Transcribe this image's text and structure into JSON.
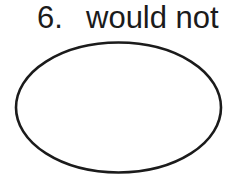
{
  "worksheet": {
    "item_number": "6.",
    "item_text": "would not",
    "answer_area": {
      "shape": "ellipse",
      "cx": 118.5,
      "cy": 107.5,
      "rx": 102.5,
      "ry": 65,
      "stroke_width": 2.6,
      "fill": "none"
    },
    "colors": {
      "ink": "#1b1b1b",
      "background": "#ffffff"
    }
  }
}
